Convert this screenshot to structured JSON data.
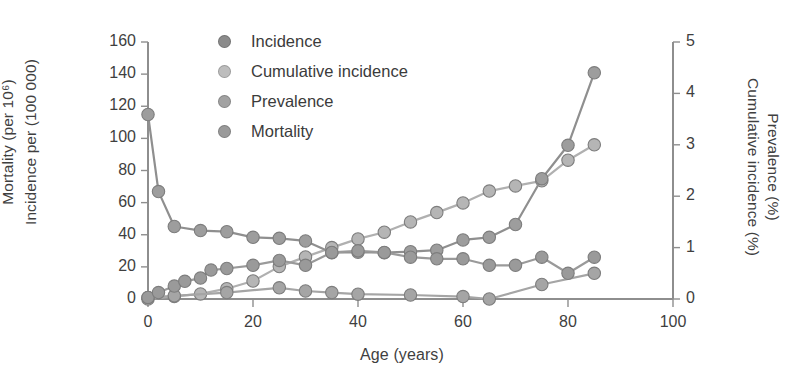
{
  "chart_data": {
    "type": "line",
    "title": "",
    "xlabel": "Age (years)",
    "ylabel_left_line1": "Mortality (per 10⁶)",
    "ylabel_left_line2": "Incidence per (100 000)",
    "ylabel_right_line1": "Cumulative incidence (%)",
    "ylabel_right_line2": "Prevalence (%)",
    "xlim": [
      0,
      100
    ],
    "xticks": [
      0,
      20,
      40,
      60,
      80,
      100
    ],
    "xtick_labels": [
      "0",
      "20",
      "40",
      "60",
      "80",
      "100"
    ],
    "ylim_left": [
      0,
      160
    ],
    "yticks_left": [
      0,
      20,
      40,
      60,
      80,
      100,
      120,
      140,
      160
    ],
    "ytick_labels_left": [
      "0",
      "20",
      "40",
      "60",
      "80",
      "100",
      "120",
      "140",
      "160"
    ],
    "ylim_right": [
      0,
      5
    ],
    "yticks_right": [
      0,
      1,
      2,
      3,
      4,
      5
    ],
    "ytick_labels_right": [
      "0",
      "1",
      "2",
      "3",
      "4",
      "5"
    ],
    "grid": false,
    "legend_position": "top-center",
    "marker": "circle",
    "series": [
      {
        "name": "Incidence",
        "axis": "left",
        "color": "#9a9a9a",
        "marker_color": "#9a9a9a",
        "x": [
          0,
          2,
          5,
          7,
          10,
          12,
          15,
          20,
          25,
          30,
          35,
          40,
          45,
          50,
          55,
          60,
          65,
          70,
          75,
          80,
          85
        ],
        "y": [
          1,
          4,
          8,
          11,
          13,
          18,
          19,
          21,
          24,
          21,
          29,
          30,
          29,
          26,
          25,
          25,
          21,
          21,
          26,
          16,
          26
        ]
      },
      {
        "name": "Cumulative incidence",
        "axis": "right",
        "color": "#b0b0b0",
        "marker_color": "#b5b5b5",
        "x": [
          0,
          5,
          10,
          15,
          20,
          25,
          30,
          35,
          40,
          45,
          50,
          55,
          60,
          65,
          70,
          75,
          80,
          85
        ],
        "y": [
          0.0,
          0.05,
          0.1,
          0.2,
          0.35,
          0.63,
          0.82,
          1.0,
          1.17,
          1.3,
          1.5,
          1.68,
          1.87,
          2.1,
          2.2,
          2.3,
          2.7,
          3.0
        ],
        "y_left_equivalent": [
          0,
          2,
          4,
          7,
          11,
          20,
          26,
          32,
          37,
          42,
          48,
          54,
          60,
          67,
          70,
          74,
          86,
          96
        ]
      },
      {
        "name": "Prevalence",
        "axis": "right",
        "color": "#8f8f8f",
        "marker_color": "#9d9d9d",
        "x": [
          0,
          2,
          5,
          10,
          15,
          20,
          25,
          30,
          35,
          40,
          45,
          50,
          55,
          60,
          65,
          70,
          75,
          80,
          85
        ],
        "y": [
          3.59,
          2.09,
          1.41,
          1.33,
          1.31,
          1.2,
          1.18,
          1.13,
          0.9,
          0.91,
          0.9,
          0.92,
          0.95,
          1.15,
          1.2,
          1.45,
          2.34,
          2.99,
          4.4
        ],
        "y_left_equivalent": [
          115,
          67,
          45,
          43,
          42,
          38,
          38,
          36,
          29,
          29,
          29,
          29,
          30,
          37,
          38,
          46,
          75,
          96,
          141
        ]
      },
      {
        "name": "Mortality",
        "axis": "left",
        "color": "#a5a5a5",
        "marker_color": "#a5a5a5",
        "x": [
          0,
          5,
          15,
          25,
          30,
          35,
          40,
          50,
          60,
          65,
          75,
          85
        ],
        "y": [
          1,
          2,
          4,
          7,
          5,
          4,
          3,
          2.5,
          1.5,
          0,
          9,
          16
        ]
      }
    ]
  },
  "legend": {
    "items": [
      {
        "label": "Incidence",
        "color": "#8b8b8b"
      },
      {
        "label": "Cumulative incidence",
        "color": "#bdbdbd"
      },
      {
        "label": "Prevalence",
        "color": "#a2a2a2"
      },
      {
        "label": "Mortality",
        "color": "#9a9a9a"
      }
    ]
  },
  "style": {
    "axis_color": "#8e8e8e",
    "text_color": "#3f3f3f",
    "background": "#ffffff"
  }
}
